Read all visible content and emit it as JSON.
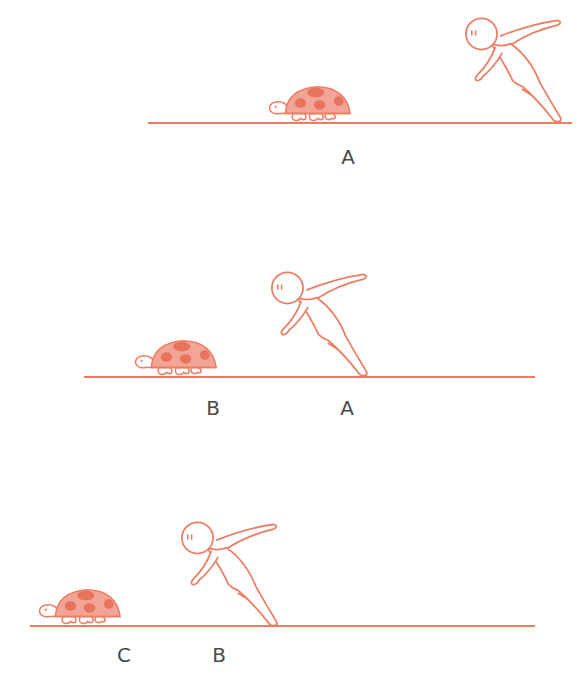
{
  "colors": {
    "stroke": "#ec7d62",
    "shell": "#f2a497",
    "spots": "#e8735c",
    "label": "#4a4a4a",
    "background": "#ffffff"
  },
  "panels": [
    {
      "ground": {
        "x1": 148,
        "x2": 572,
        "y": 123
      },
      "turtle": {
        "x": 268,
        "y": 84
      },
      "runner": {
        "x": 462,
        "y": 14
      },
      "labels": [
        {
          "text": "A",
          "x": 348,
          "y": 147
        }
      ]
    },
    {
      "ground": {
        "x1": 84,
        "x2": 535,
        "y": 377
      },
      "turtle": {
        "x": 134,
        "y": 338
      },
      "runner": {
        "x": 268,
        "y": 272
      },
      "labels": [
        {
          "text": "B",
          "x": 213,
          "y": 398
        },
        {
          "text": "A",
          "x": 347,
          "y": 398
        }
      ]
    },
    {
      "ground": {
        "x1": 30,
        "x2": 535,
        "y": 626
      },
      "turtle": {
        "x": 38,
        "y": 587
      },
      "runner": {
        "x": 180,
        "y": 522
      },
      "labels": [
        {
          "text": "C",
          "x": 124,
          "y": 645
        },
        {
          "text": "B",
          "x": 219,
          "y": 645
        }
      ]
    }
  ],
  "labels_flat": [
    "A",
    "B",
    "A",
    "C",
    "B"
  ],
  "icons": {
    "turtle": "turtle-icon",
    "runner": "running-person-icon"
  }
}
